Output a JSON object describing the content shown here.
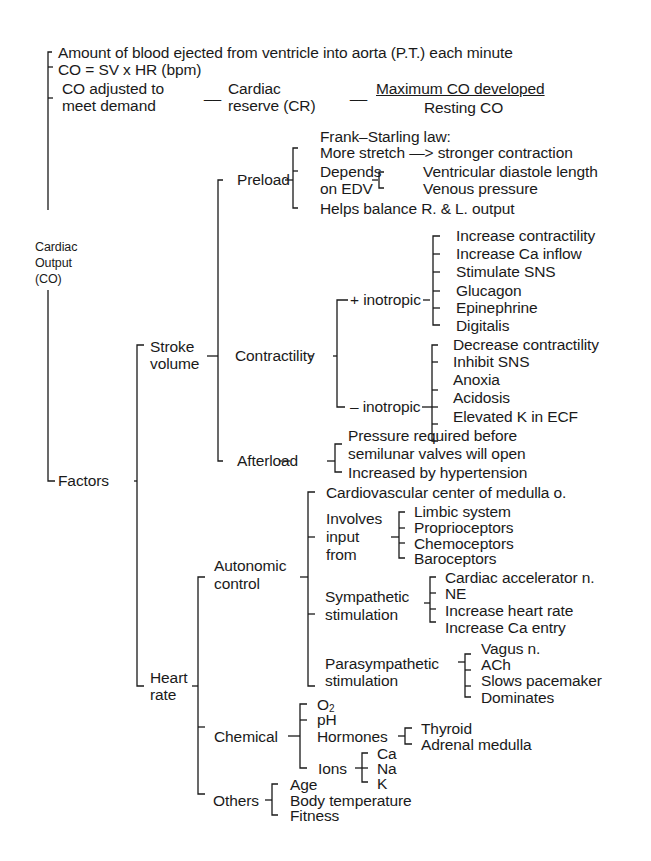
{
  "root": {
    "line1": "Cardiac",
    "line2": "Output",
    "line3": "(CO)"
  },
  "definition": {
    "amount": "Amount of blood ejected from ventricle into aorta  (P.T.) each minute",
    "formula": "CO = SV x HR (bpm)",
    "adjusted_line1": "CO adjusted to",
    "adjusted_line2": "meet demand",
    "reserve_line1": "Cardiac",
    "reserve_line2": "reserve  (CR)",
    "fraction_numerator": "Maximum CO developed",
    "fraction_denominator": "Resting CO"
  },
  "factors": {
    "label": "Factors",
    "stroke_volume": {
      "label_line1": "Stroke",
      "label_line2": "volume",
      "preload": {
        "label": "Preload",
        "frank_starling": "Frank–Starling law:",
        "more_stretch": "More stretch —> stronger contraction",
        "depends_line1": "Depends",
        "depends_line2": "on EDV",
        "edv_items": [
          "Ventricular diastole length",
          "Venous pressure"
        ],
        "helps": "Helps balance R. & L. output"
      },
      "contractility": {
        "label": "Contractility",
        "positive": {
          "label": "+ inotropic",
          "items": [
            "Increase contractility",
            "Increase Ca inflow",
            "Stimulate SNS",
            "Glucagon",
            "Epinephrine",
            "Digitalis"
          ]
        },
        "negative": {
          "label": "– inotropic",
          "items": [
            "Decrease contractility",
            "Inhibit SNS",
            "Anoxia",
            "Acidosis",
            "Elevated K in ECF"
          ]
        }
      },
      "afterload": {
        "label": "Afterload",
        "items": [
          "Pressure required before",
          "semilunar valves will open",
          "Increased by hypertension"
        ]
      }
    },
    "heart_rate": {
      "label_line1": "Heart",
      "label_line2": "rate",
      "autonomic": {
        "label_line1": "Autonomic",
        "label_line2": "control",
        "center": "Cardiovascular center of medulla o.",
        "involves_line1": "Involves",
        "involves_line2": "input",
        "involves_line3": "from",
        "inputs": [
          "Limbic system",
          "Proprioceptors",
          "Chemoceptors",
          "Baroceptors"
        ],
        "sympathetic_line1": "Sympathetic",
        "sympathetic_line2": "stimulation",
        "sympathetic_items": [
          "Cardiac accelerator n.",
          "NE",
          "Increase heart rate",
          "Increase Ca entry"
        ],
        "parasympathetic_line1": "Parasympathetic",
        "parasympathetic_line2": "stimulation",
        "parasympathetic_items": [
          "Vagus n.",
          "ACh",
          "Slows pacemaker",
          "Dominates"
        ]
      },
      "chemical": {
        "label": "Chemical",
        "o2": "O",
        "o2_sub": "2",
        "ph": "pH",
        "hormones": "Hormones",
        "hormone_items": [
          "Thyroid",
          "Adrenal medulla"
        ],
        "ions": "Ions",
        "ion_items": [
          "Ca",
          "Na",
          "K"
        ]
      },
      "others": {
        "label": "Others",
        "items": [
          "Age",
          "Body temperature",
          "Fitness"
        ]
      }
    }
  }
}
